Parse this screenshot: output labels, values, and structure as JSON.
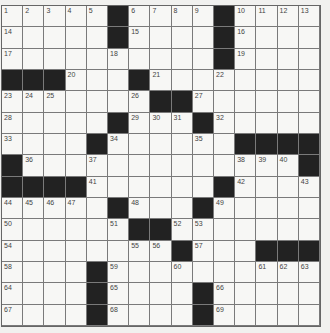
{
  "puzzle": {
    "rows": 15,
    "cols": 15,
    "grid": [
      [
        "1",
        "2",
        "3",
        "4",
        "5",
        "#",
        "6",
        "7",
        "8",
        "9",
        "#",
        "10",
        "11",
        "12",
        "13"
      ],
      [
        "14",
        "",
        "",
        "",
        "",
        "#",
        "15",
        "",
        "",
        "",
        "#",
        "16",
        "",
        "",
        ""
      ],
      [
        "17",
        "",
        "",
        "",
        "",
        "18",
        "",
        "",
        "",
        "",
        "#",
        "19",
        "",
        "",
        ""
      ],
      [
        "#",
        "#",
        "#",
        "20",
        "",
        "",
        "#",
        "21",
        "",
        "",
        "22",
        "",
        "",
        "",
        ""
      ],
      [
        "23",
        "24",
        "25",
        "",
        "",
        "",
        "26",
        "#",
        "#",
        "27",
        "",
        "",
        "",
        "",
        ""
      ],
      [
        "28",
        "",
        "",
        "",
        "",
        "#",
        "29",
        "30",
        "31",
        "#",
        "32",
        "",
        "",
        "",
        ""
      ],
      [
        "33",
        "",
        "",
        "",
        "#",
        "34",
        "",
        "",
        "",
        "35",
        "",
        "#",
        "#",
        "#",
        "#"
      ],
      [
        "#",
        "36",
        "",
        "",
        "37",
        "",
        "",
        "",
        "",
        "",
        "",
        "38",
        "39",
        "40",
        "#"
      ],
      [
        "#",
        "#",
        "#",
        "#",
        "41",
        "",
        "",
        "",
        "",
        "",
        "#",
        "42",
        "",
        "",
        "43"
      ],
      [
        "44",
        "45",
        "46",
        "47",
        "",
        "#",
        "48",
        "",
        "",
        "#",
        "49",
        "",
        "",
        "",
        ""
      ],
      [
        "50",
        "",
        "",
        "",
        "",
        "51",
        "#",
        "#",
        "52",
        "53",
        "",
        "",
        "",
        "",
        ""
      ],
      [
        "54",
        "",
        "",
        "",
        "",
        "",
        "55",
        "56",
        "#",
        "57",
        "",
        "",
        "#",
        "#",
        "#"
      ],
      [
        "58",
        "",
        "",
        "",
        "#",
        "59",
        "",
        "",
        "60",
        "",
        "",
        "",
        "61",
        "62",
        "63"
      ],
      [
        "64",
        "",
        "",
        "",
        "#",
        "65",
        "",
        "",
        "",
        "#",
        "66",
        "",
        "",
        "",
        ""
      ],
      [
        "67",
        "",
        "",
        "",
        "#",
        "68",
        "",
        "",
        "",
        "#",
        "69",
        "",
        "",
        "",
        ""
      ]
    ]
  }
}
